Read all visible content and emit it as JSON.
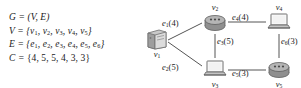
{
  "definitions": [
    {
      "name": "definition-G",
      "text": "G = (V, E)"
    },
    {
      "name": "definition-V",
      "text": "V = {v1, v2, v3, v4, v5}"
    },
    {
      "name": "definition-E",
      "text": "E = {e1, e2, e3, e4, e5, e6}"
    },
    {
      "name": "definition-C",
      "text": "C = {4, 5, 5, 4, 3, 3}"
    }
  ],
  "graph": {
    "nodes": [
      {
        "id": "v1",
        "label": "v1",
        "icon": "server-icon",
        "label_position": "below"
      },
      {
        "id": "v2",
        "label": "v2",
        "icon": "router-icon",
        "label_position": "above"
      },
      {
        "id": "v3",
        "label": "v3",
        "icon": "laptop-icon",
        "label_position": "below"
      },
      {
        "id": "v4",
        "label": "v4",
        "icon": "laptop-icon",
        "label_position": "above"
      },
      {
        "id": "v5",
        "label": "v5",
        "icon": "router-icon",
        "label_position": "below"
      }
    ],
    "edges": [
      {
        "id": "e1",
        "source": "v1",
        "target": "v2",
        "label": "e1(4)",
        "cost": 4
      },
      {
        "id": "e2",
        "source": "v1",
        "target": "v3",
        "label": "e2(5)",
        "cost": 5
      },
      {
        "id": "e3",
        "source": "v2",
        "target": "v3",
        "label": "e3(5)",
        "cost": 5
      },
      {
        "id": "e4",
        "source": "v2",
        "target": "v4",
        "label": "e4(4)",
        "cost": 4
      },
      {
        "id": "e5",
        "source": "v3",
        "target": "v5",
        "label": "e5(3)",
        "cost": 3
      },
      {
        "id": "e6",
        "source": "v4",
        "target": "v5",
        "label": "e6(3)",
        "cost": 3
      }
    ]
  },
  "colors": {
    "background": "#ffffff",
    "text": "#1a1a1a",
    "edge_line": "#555555",
    "icon_fill": "#b8b8b8",
    "icon_stroke": "#6e6e6e"
  }
}
